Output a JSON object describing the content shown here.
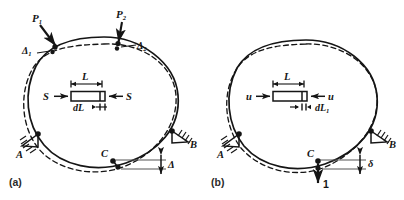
{
  "figure": {
    "background_color": "#ffffff",
    "line_color": "#151515",
    "dimension_line_color": "#555555",
    "panels": [
      {
        "id": "a",
        "caption": "(a)",
        "description": "Ring loaded by P1 and P2, showing deflections at load points and at C",
        "loads": [
          {
            "name": "load-p1",
            "label": "P",
            "subscript": "1"
          },
          {
            "name": "load-p2",
            "label": "P",
            "subscript": "2"
          }
        ],
        "deflections": [
          {
            "name": "deflection-delta1",
            "label": "Δ",
            "subscript": "1"
          },
          {
            "name": "deflection-delta2",
            "label": "Δ",
            "subscript": "2"
          },
          {
            "name": "deflection-delta-c",
            "label": "Δ",
            "subscript": ""
          }
        ],
        "supports": [
          {
            "name": "support-a",
            "label": "A"
          },
          {
            "name": "support-b",
            "label": "B"
          }
        ],
        "points": [
          {
            "name": "point-c",
            "label": "C"
          }
        ],
        "element": {
          "length_label": "L",
          "elongation_label": "dL",
          "elongation_subscript": "",
          "force_label_left": "S",
          "force_label_right": "S"
        }
      },
      {
        "id": "b",
        "caption": "(b)",
        "description": "Same ring with a unit load applied at C, showing virtual deflection delta",
        "loads": [
          {
            "name": "unit-load",
            "label": "1",
            "subscript": ""
          }
        ],
        "deflections": [
          {
            "name": "deflection-delta-c",
            "label": "δ",
            "subscript": ""
          }
        ],
        "supports": [
          {
            "name": "support-a",
            "label": "A"
          },
          {
            "name": "support-b",
            "label": "B"
          }
        ],
        "points": [
          {
            "name": "point-c",
            "label": "C"
          }
        ],
        "element": {
          "length_label": "L",
          "elongation_label": "dL",
          "elongation_subscript": "1",
          "force_label_left": "u",
          "force_label_right": "u"
        }
      }
    ]
  }
}
